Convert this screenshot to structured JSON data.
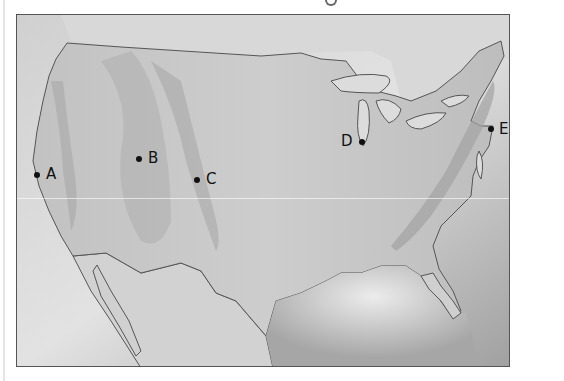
{
  "map": {
    "description": "Shaded relief map of the contiguous United States",
    "colors": {
      "land": "#cbcbcb",
      "water_light": "#e4e4e4",
      "water_dark": "#9a9a9a",
      "coastline": "#555555",
      "relief": "#a8a8a8",
      "point": "#111111"
    },
    "points": [
      {
        "label": "A",
        "x": 37,
        "y": 175,
        "label_side": "right"
      },
      {
        "label": "B",
        "x": 139,
        "y": 159,
        "label_side": "right"
      },
      {
        "label": "C",
        "x": 197,
        "y": 180,
        "label_side": "right"
      },
      {
        "label": "D",
        "x": 362,
        "y": 142,
        "label_side": "left"
      },
      {
        "label": "E",
        "x": 491,
        "y": 129,
        "label_side": "right"
      }
    ]
  }
}
